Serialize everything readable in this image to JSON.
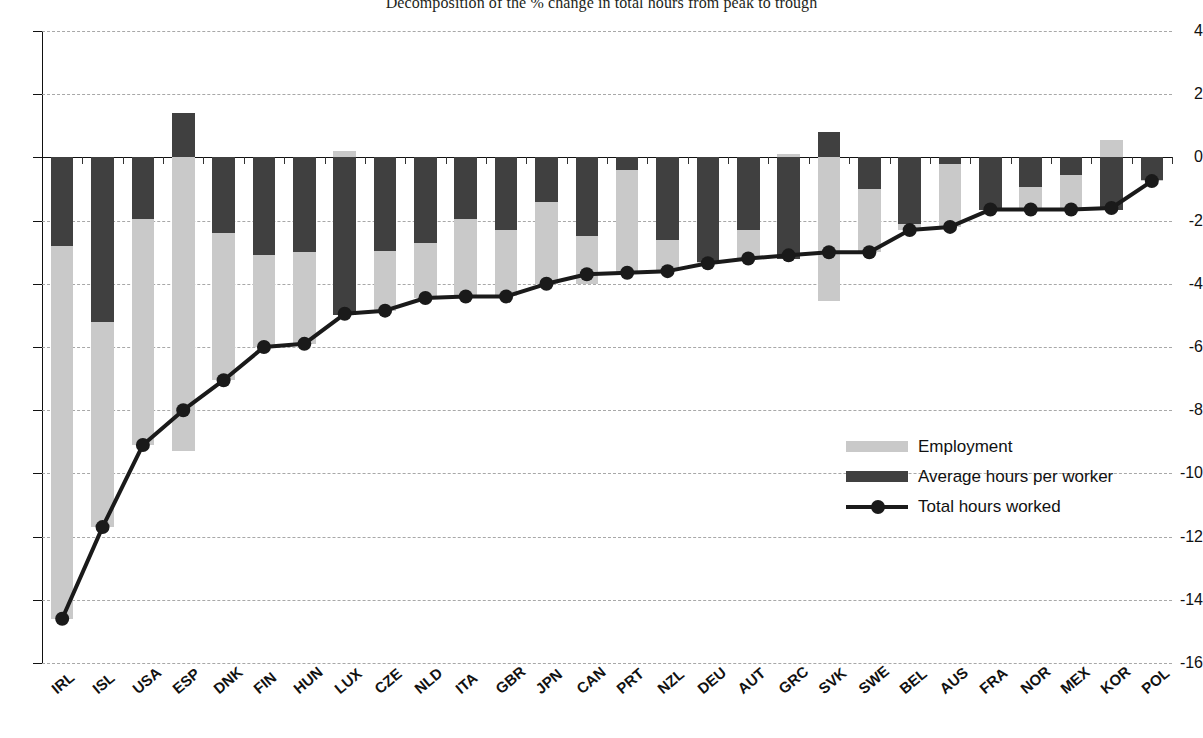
{
  "title": "Decomposition of the % change in total hours from peak to trough",
  "legend": {
    "position": "inside-right",
    "items": [
      {
        "label": "Employment",
        "marker": "light-gray-bar",
        "color": "#c9c9c9"
      },
      {
        "label": "Average hours per worker",
        "marker": "dark-gray-bar",
        "color": "#404040"
      },
      {
        "label": "Total hours worked",
        "marker": "line-with-round-markers",
        "color": "#1a1a1a"
      }
    ]
  },
  "chart_data": {
    "type": "bar",
    "stacked": true,
    "title": "Decomposition of the % change in total hours from peak to trough",
    "xlabel": "",
    "ylabel": "",
    "ylim": [
      -16,
      4
    ],
    "yticks": [
      4,
      2,
      0,
      -2,
      -4,
      -6,
      -8,
      -10,
      -12,
      -14,
      -16
    ],
    "grid": "horizontal-dashed",
    "categories": [
      "IRL",
      "ISL",
      "USA",
      "ESP",
      "DNK",
      "FIN",
      "HUN",
      "LUX",
      "CZE",
      "NLD",
      "ITA",
      "GBR",
      "JPN",
      "CAN",
      "PRT",
      "NZL",
      "DEU",
      "AUT",
      "GRC",
      "SVK",
      "SWE",
      "BEL",
      "AUS",
      "FRA",
      "NOR",
      "MEX",
      "KOR",
      "POL"
    ],
    "series": [
      {
        "name": "Average hours per worker",
        "type": "bar",
        "color": "#404040",
        "values": [
          -2.8,
          -5.2,
          -1.95,
          1.4,
          -2.4,
          -3.1,
          -3.0,
          -5.0,
          -2.95,
          -2.7,
          -1.95,
          -2.3,
          -1.4,
          -2.5,
          -0.4,
          -2.6,
          -3.3,
          -2.3,
          -3.2,
          0.8,
          -1.0,
          -2.1,
          -0.2,
          -1.65,
          -0.95,
          -0.55,
          -1.65,
          -0.7
        ]
      },
      {
        "name": "Employment",
        "type": "bar",
        "color": "#c9c9c9",
        "values": [
          -11.8,
          -6.5,
          -7.15,
          -9.3,
          -4.65,
          -2.9,
          -2.9,
          0.2,
          -1.9,
          -1.75,
          -2.45,
          -2.1,
          -2.6,
          -1.5,
          -3.25,
          -1.0,
          -0.05,
          -0.9,
          0.1,
          -4.55,
          -2.0,
          -0.2,
          -2.0,
          0.0,
          -0.7,
          -1.1,
          0.55,
          -0.05
        ]
      },
      {
        "name": "Total hours worked",
        "type": "line",
        "color": "#1a1a1a",
        "marker": "o",
        "values": [
          -14.6,
          -11.7,
          -9.1,
          -8.0,
          -7.05,
          -6.0,
          -5.9,
          -4.95,
          -4.85,
          -4.45,
          -4.4,
          -4.4,
          -4.0,
          -3.7,
          -3.65,
          -3.6,
          -3.35,
          -3.2,
          -3.1,
          -3.0,
          -3.0,
          -2.3,
          -2.2,
          -1.65,
          -1.65,
          -1.65,
          -1.6,
          -0.75
        ]
      }
    ]
  }
}
